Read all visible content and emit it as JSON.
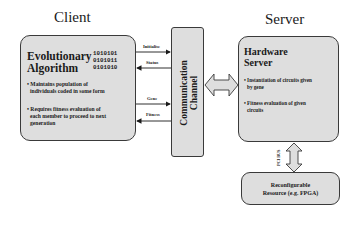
{
  "client": {
    "title": "Client",
    "box_title_line1": "Evolutionary",
    "box_title_line2": "Algorithm",
    "binary": [
      "1010101",
      "0101011",
      "0101010"
    ],
    "bullets": [
      {
        "line1": "• Maintains population of",
        "line2": "individuals coded in some form"
      },
      {
        "line1": "• Requires fitness evaluation of",
        "line2": "each member to proceed to next",
        "line3": "generation"
      }
    ]
  },
  "channel": {
    "line1": "Communication",
    "line2": "Channel"
  },
  "signals": [
    {
      "label": "Initialise",
      "direction": "to-channel"
    },
    {
      "label": "Status",
      "direction": "to-client"
    },
    {
      "label": "Gene",
      "direction": "to-channel"
    },
    {
      "label": "Fitness",
      "direction": "to-client"
    }
  ],
  "server": {
    "title": "Server",
    "box_title_line1": "Hardware",
    "box_title_line2": "Server",
    "icon": "logic-gates-icon",
    "bullets": [
      {
        "line1": "• Instantiation of circuits given",
        "line2": "by gene"
      },
      {
        "line1": "• Fitness evaluation of given",
        "line2": "circuits"
      }
    ]
  },
  "bus": {
    "label": "PCI BUS"
  },
  "fpga": {
    "line1": "Reconfigurable",
    "line2": "Resource (e.g. FPGA)"
  },
  "colors": {
    "box_fill": "#dedede",
    "border": "#3a3a3a",
    "text": "#1a1a1a",
    "background": "#ffffff"
  }
}
